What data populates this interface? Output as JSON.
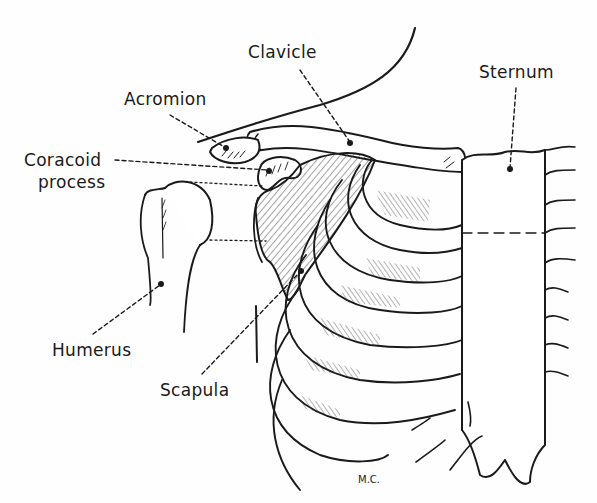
{
  "diagram": {
    "type": "anatomical-line-drawing",
    "ink_color": "#1a1a1a",
    "background": "#fefefe",
    "labels": {
      "clavicle": "Clavicle",
      "sternum": "Sternum",
      "acromion": "Acromion",
      "coracoid_line1": "Coracoid",
      "coracoid_line2": "process",
      "humerus": "Humerus",
      "scapula": "Scapula"
    },
    "signature": "M.C."
  }
}
